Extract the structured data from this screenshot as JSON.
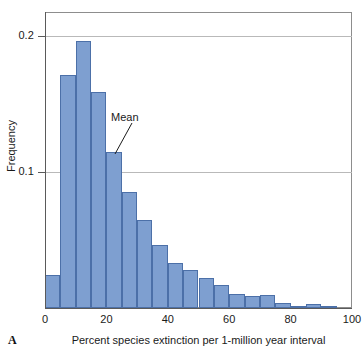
{
  "panel": {
    "letter": "A"
  },
  "axes": {
    "x_title": "Percent species extinction per 1-million year interval",
    "y_title": "Frequency",
    "x_ticks": [
      "0",
      "20",
      "40",
      "60",
      "80",
      "100"
    ],
    "y_ticks": [
      "0.2",
      "0.1"
    ]
  },
  "annotations": {
    "mean_label": "Mean"
  },
  "colors": {
    "bar_fill": "#7e9fd0",
    "bar_stroke": "#4c70a8",
    "gridline": "#b9b9b9",
    "axis": "#5a5a5a",
    "text": "#1a1a1a"
  },
  "chart_data": {
    "type": "bar",
    "title": "",
    "subtitle": "",
    "xlabel": "Percent species extinction per 1-million year interval",
    "ylabel": "Frequency",
    "xlim": [
      0,
      100
    ],
    "ylim": [
      0,
      0.218
    ],
    "xticks": [
      0,
      20,
      40,
      60,
      80,
      100
    ],
    "yticks": [
      0.1,
      0.2
    ],
    "grid": true,
    "legend": null,
    "bin_width": 5,
    "bin_edges": [
      0,
      5,
      10,
      15,
      20,
      25,
      30,
      35,
      40,
      45,
      50,
      55,
      60,
      65,
      70,
      75,
      80,
      85,
      90,
      95
    ],
    "categories": [
      "0-5",
      "5-10",
      "10-15",
      "15-20",
      "20-25",
      "25-30",
      "30-35",
      "35-40",
      "40-45",
      "45-50",
      "50-55",
      "55-60",
      "60-65",
      "65-70",
      "70-75",
      "75-80",
      "80-85",
      "85-90",
      "90-95"
    ],
    "values": [
      0.024,
      0.171,
      0.196,
      0.159,
      0.115,
      0.085,
      0.065,
      0.046,
      0.033,
      0.028,
      0.022,
      0.017,
      0.01,
      0.009,
      0.0095,
      0.0037,
      0.0015,
      0.003,
      0.0015
    ],
    "annotations": [
      {
        "text": "Mean",
        "points_to_x": 22.5,
        "points_to_y": 0.115
      }
    ]
  }
}
